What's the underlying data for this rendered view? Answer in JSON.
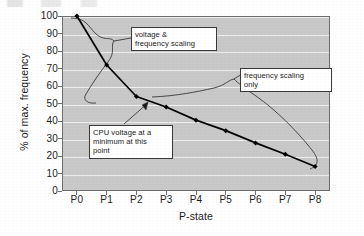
{
  "chart_data": {
    "type": "line",
    "title": "",
    "xlabel": "P-state",
    "ylabel": "% of max. frequency",
    "categories": [
      "P0",
      "P1",
      "P2",
      "P3",
      "P4",
      "P5",
      "P6",
      "P7",
      "P8"
    ],
    "series": [
      {
        "name": "% of max. frequency",
        "values": [
          100,
          72,
          54,
          48,
          40.5,
          34.5,
          27.5,
          21,
          14
        ]
      }
    ],
    "ylim": [
      0,
      100
    ],
    "yticks": [
      0,
      10,
      20,
      30,
      40,
      50,
      60,
      70,
      80,
      90,
      100
    ],
    "ytick_labels": [
      "0",
      "10",
      "20",
      "30",
      "40",
      "50",
      "60",
      "70",
      "80",
      "90",
      "100"
    ],
    "grid": true,
    "legend": "none",
    "marker": "filled-diamond",
    "line_color": "#000000",
    "plot_background": "#c9c9c9",
    "gridline_color": "#efefef",
    "annotations": [
      {
        "name": "voltage-and-frequency-scaling",
        "lines": [
          "voltage &",
          "frequency scaling"
        ],
        "spans": "P0 to P2",
        "brace": "left-curly"
      },
      {
        "name": "frequency-scaling-only",
        "lines": [
          "frequency scaling",
          "only"
        ],
        "spans": "P2 to P8",
        "brace": "left-curly"
      },
      {
        "name": "cpu-voltage-minimum",
        "lines": [
          "CPU voltage at a",
          "minimum at this",
          "point"
        ],
        "points_to": "P2",
        "brace": "arrow"
      }
    ]
  },
  "colors": {
    "plot_background": "#c9c9c9",
    "gridline": "#efefef",
    "series_line": "#000000",
    "axis_border": "#6e6e6e",
    "callout_border": "#3a3a3a",
    "callout_background": "#ffffff",
    "text": "#1c1c1c"
  }
}
